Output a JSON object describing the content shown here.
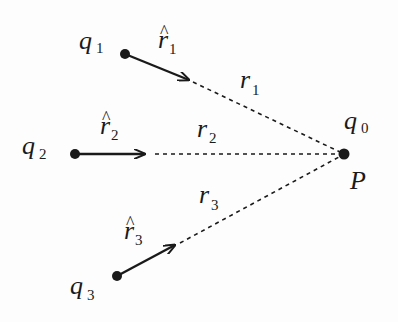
{
  "figure": {
    "width": 398,
    "height": 322,
    "colors": {
      "ink": "#1a1a1a",
      "background": "#fdfdfd"
    },
    "target": {
      "charge_label": "q",
      "charge_sub": "0",
      "point_label": "P",
      "x": 344,
      "y": 154
    },
    "charges": [
      {
        "label": "q",
        "sub": "1",
        "x": 125,
        "y": 54,
        "unit_vector": {
          "label": "r",
          "sub": "1",
          "hat": "^",
          "tip_x": 190,
          "tip_y": 80
        },
        "distance": {
          "label": "r",
          "sub": "1"
        }
      },
      {
        "label": "q",
        "sub": "2",
        "x": 75,
        "y": 154,
        "unit_vector": {
          "label": "r",
          "sub": "2",
          "hat": "^",
          "tip_x": 146,
          "tip_y": 154
        },
        "distance": {
          "label": "r",
          "sub": "2"
        }
      },
      {
        "label": "q",
        "sub": "3",
        "x": 117,
        "y": 276,
        "unit_vector": {
          "label": "r",
          "sub": "3",
          "hat": "^",
          "tip_x": 176,
          "tip_y": 245
        },
        "distance": {
          "label": "r",
          "sub": "3"
        }
      }
    ]
  }
}
